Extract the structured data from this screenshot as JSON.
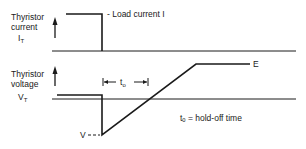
{
  "diagram": {
    "current_panel": {
      "ylabel_line1": "Thyristor",
      "ylabel_line2": "current",
      "ylabel_symbol": "I",
      "ylabel_subscript": "T",
      "annotation": "- Load current I"
    },
    "voltage_panel": {
      "ylabel_line1": "Thyristor",
      "ylabel_line2": "voltage",
      "ylabel_symbol": "V",
      "ylabel_subscript": "T",
      "level_high": "E",
      "level_low": "V - - -",
      "interval_symbol": "t",
      "interval_subscript": "o",
      "legend": "tₒ = hold-off time"
    },
    "colors": {
      "line": "#1a1a1a",
      "background": "#ffffff"
    }
  }
}
